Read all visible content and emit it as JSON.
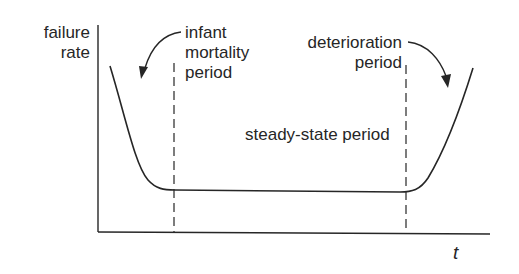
{
  "diagram": {
    "type": "bathtub-curve",
    "y_axis_label_line1": "failure",
    "y_axis_label_line2": "rate",
    "x_axis_label": "t",
    "regions": {
      "infant": {
        "line1": "infant",
        "line2": "mortality",
        "line3": "period"
      },
      "steady": {
        "label": "steady-state period"
      },
      "deterioration": {
        "line1": "deterioration",
        "line2": "period"
      }
    },
    "colors": {
      "ink": "#262626",
      "background": "#ffffff"
    }
  }
}
